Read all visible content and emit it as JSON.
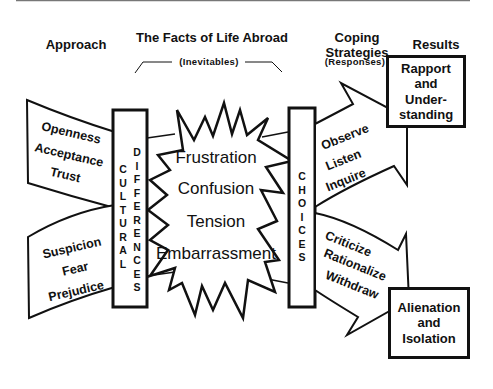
{
  "headers": {
    "approach": "Approach",
    "facts": "The Facts of Life Abroad",
    "coping_line1": "Coping",
    "coping_line2": "Strategies",
    "results": "Results"
  },
  "subheaders": {
    "inevitables": "(Inevitables)",
    "responses": "(Responses)"
  },
  "bars": {
    "cultural": "CULTURAL",
    "differences": "DIFFERENCES",
    "choices": "CHOICES"
  },
  "approach_positive": [
    "Openness",
    "Acceptance",
    "Trust"
  ],
  "approach_negative": [
    "Suspicion",
    "Fear",
    "Prejudice"
  ],
  "facts": [
    "Frustration",
    "Confusion",
    "Tension",
    "Embarrassment"
  ],
  "coping_positive": [
    "Observe",
    "Listen",
    "Inquire"
  ],
  "coping_negative": [
    "Criticize",
    "Rationalize",
    "Withdraw"
  ],
  "results": {
    "positive": [
      "Rapport",
      "and",
      "Under-",
      "standing"
    ],
    "negative": [
      "Alienation",
      "and",
      "Isolation"
    ]
  },
  "colors": {
    "stroke": "#111111",
    "background": "#ffffff"
  }
}
